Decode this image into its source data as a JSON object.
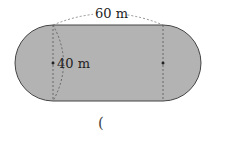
{
  "diagram": {
    "type": "stadium-shape (rectangle with two semicircles)",
    "labels": {
      "length": "60 m",
      "diameter": "40 m"
    },
    "answer_blank": "(",
    "colors": {
      "fill": "#b3b3b3",
      "stroke": "#444444",
      "dashed": "#555555"
    }
  }
}
